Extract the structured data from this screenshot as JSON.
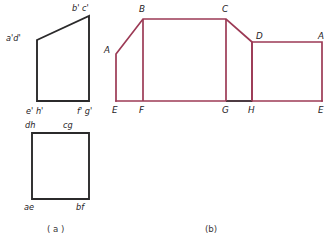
{
  "figure": {
    "stroke_colors": {
      "ortho_line": "#2b2a2b",
      "development_line": "#9c3a55",
      "development_line_dark": "#3a3338",
      "label_text": "#262226",
      "caption_text": "#3a3539",
      "background": "#ffffff"
    },
    "captions": [
      {
        "key": "a",
        "text": "( a )",
        "x": 47,
        "y": 232
      },
      {
        "key": "b",
        "text": "(b)",
        "x": 205,
        "y": 232
      }
    ],
    "panel_a": {
      "name": "orthographic-views",
      "front_view": {
        "name": "front-view-trapezoid",
        "points": "37,40 89,16 89,101 37,101",
        "vertices": [
          {
            "id": "a1d1",
            "label": "a'd'",
            "px": 37,
            "py": 40,
            "tx": 6,
            "ty": 41
          },
          {
            "id": "b1c1",
            "label": "b' c'",
            "px": 89,
            "py": 16,
            "tx": 72,
            "ty": 11
          },
          {
            "id": "f1g1",
            "label": "f' g'",
            "px": 89,
            "py": 101,
            "tx": 77,
            "ty": 114
          },
          {
            "id": "e1h1",
            "label": "e' h'",
            "px": 37,
            "py": 101,
            "tx": 26,
            "ty": 114
          }
        ]
      },
      "top_view": {
        "name": "top-view-rectangle",
        "points": "32,133 89,133 89,199 32,199",
        "vertices": [
          {
            "id": "dh",
            "label": "dh",
            "px": 32,
            "py": 133,
            "tx": 25,
            "ty": 128
          },
          {
            "id": "cg",
            "label": "cg",
            "px": 89,
            "py": 133,
            "tx": 63,
            "ty": 128
          },
          {
            "id": "bf",
            "label": "bf",
            "px": 89,
            "py": 199,
            "tx": 76,
            "ty": 210
          },
          {
            "id": "ae",
            "label": "ae",
            "px": 32,
            "py": 199,
            "tx": 24,
            "ty": 210
          }
        ]
      }
    },
    "panel_b": {
      "name": "surface-development",
      "outline_points": "116,101 116,54 143,19 226,19 252,42 252,101",
      "base_line": {
        "x1": 116,
        "y1": 101,
        "x2": 322,
        "y2": 101
      },
      "top_right_points": "252,42 322,42 322,101",
      "fold_lines": [
        {
          "id": "fold-BF",
          "x1": 143,
          "y1": 19,
          "x2": 143,
          "y2": 101
        },
        {
          "id": "fold-CG",
          "x1": 226,
          "y1": 19,
          "x2": 226,
          "y2": 101
        },
        {
          "id": "fold-DH",
          "x1": 252,
          "y1": 42,
          "x2": 252,
          "y2": 101
        }
      ],
      "dark_segment": {
        "id": "segment-GH",
        "x1": 226,
        "y1": 101,
        "x2": 252,
        "y2": 101
      },
      "vertices": [
        {
          "id": "A-left",
          "label": "A",
          "px": 116,
          "py": 54,
          "tx": 104,
          "ty": 53
        },
        {
          "id": "B",
          "label": "B",
          "px": 143,
          "py": 19,
          "tx": 139,
          "ty": 12
        },
        {
          "id": "C",
          "label": "C",
          "px": 226,
          "py": 19,
          "tx": 222,
          "ty": 12
        },
        {
          "id": "D",
          "label": "D",
          "px": 252,
          "py": 42,
          "tx": 256,
          "ty": 39
        },
        {
          "id": "A-right",
          "label": "A",
          "px": 322,
          "py": 42,
          "tx": 318,
          "ty": 39
        },
        {
          "id": "E-left",
          "label": "E",
          "px": 116,
          "py": 101,
          "tx": 112,
          "ty": 113
        },
        {
          "id": "F",
          "label": "F",
          "px": 143,
          "py": 101,
          "tx": 139,
          "ty": 113
        },
        {
          "id": "G",
          "label": "G",
          "px": 226,
          "py": 101,
          "tx": 222,
          "ty": 113
        },
        {
          "id": "H",
          "label": "H",
          "px": 252,
          "py": 101,
          "tx": 248,
          "ty": 113
        },
        {
          "id": "E-right",
          "label": "E",
          "px": 322,
          "py": 101,
          "tx": 318,
          "ty": 113
        }
      ]
    }
  }
}
